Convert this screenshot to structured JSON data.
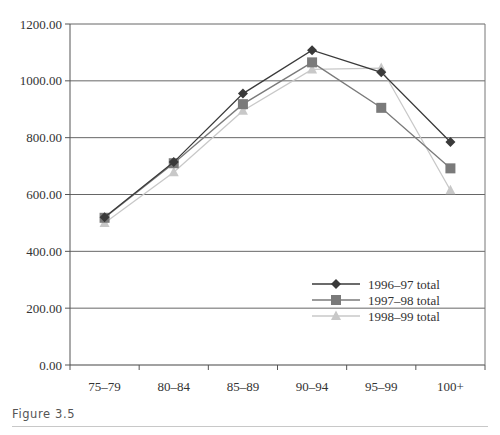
{
  "figure": {
    "caption": "Figure 3.5"
  },
  "chart_data": {
    "type": "line",
    "title": "",
    "xlabel": "",
    "ylabel": "",
    "categories": [
      "75–79",
      "80–84",
      "85–89",
      "90–94",
      "95–99",
      "100+"
    ],
    "ylim": [
      0,
      1200
    ],
    "yticks": [
      0,
      200,
      400,
      600,
      800,
      1000,
      1200
    ],
    "ytick_labels": [
      "0.00",
      "200.00",
      "400.00",
      "600.00",
      "800.00",
      "1000.00",
      "1200.00"
    ],
    "grid": true,
    "legend_position": "lower right inside",
    "series": [
      {
        "name": "1996–97 total",
        "marker": "diamond",
        "color": "#3a3a3a",
        "values": [
          520,
          714,
          955,
          1108,
          1030,
          785
        ]
      },
      {
        "name": "1997–98 total",
        "marker": "square",
        "color": "#7a7a7a",
        "values": [
          518,
          710,
          918,
          1065,
          905,
          692
        ]
      },
      {
        "name": "1998–99 total",
        "marker": "triangle",
        "color": "#c8c8c8",
        "values": [
          500,
          678,
          895,
          1040,
          1045,
          615
        ]
      }
    ]
  }
}
